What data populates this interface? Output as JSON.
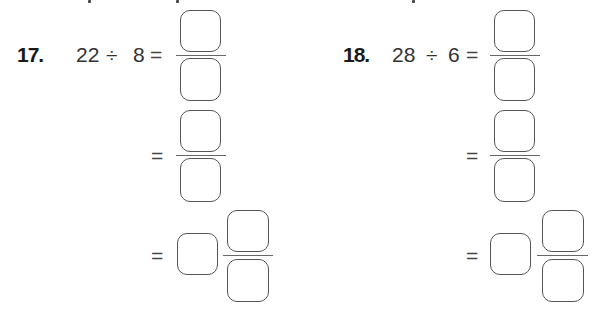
{
  "problems": [
    {
      "number": "17.",
      "dividend": "22",
      "operator": "÷",
      "divisor": "8",
      "equals": "=",
      "steps": [
        {
          "type": "fraction",
          "label": "improper-fraction",
          "numerator": "",
          "denominator": ""
        },
        {
          "type": "fraction",
          "label": "simplified-fraction",
          "numerator": "",
          "denominator": ""
        },
        {
          "type": "mixed-number",
          "label": "mixed-number",
          "whole": "",
          "numerator": "",
          "denominator": ""
        }
      ]
    },
    {
      "number": "18.",
      "dividend": "28",
      "operator": "÷",
      "divisor": "6",
      "equals": "=",
      "steps": [
        {
          "type": "fraction",
          "label": "improper-fraction",
          "numerator": "",
          "denominator": ""
        },
        {
          "type": "fraction",
          "label": "simplified-fraction",
          "numerator": "",
          "denominator": ""
        },
        {
          "type": "mixed-number",
          "label": "mixed-number",
          "whole": "",
          "numerator": "",
          "denominator": ""
        }
      ]
    }
  ],
  "colors": {
    "text": "#333333",
    "box_border": "#555555",
    "background": "#ffffff"
  }
}
